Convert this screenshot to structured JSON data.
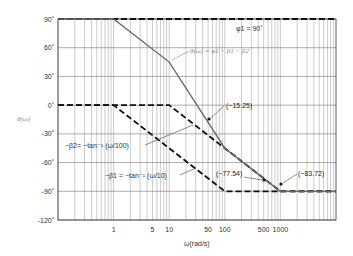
{
  "chart_data": {
    "type": "line",
    "title": "",
    "xlabel": "ω(rad/s)",
    "ylabel": "θ(ω)",
    "xscale": "log",
    "xlim": [
      0.1,
      10000
    ],
    "ylim": [
      -120,
      90
    ],
    "x_tick_labels": [
      "1",
      "5",
      "10",
      "50",
      "100",
      "500",
      "1000"
    ],
    "x_tick_values": [
      1,
      5,
      10,
      50,
      100,
      500,
      1000
    ],
    "y_tick_labels": [
      "90˚",
      "60˚",
      "30˚",
      "0˚",
      "-30˚",
      "-60˚",
      "-90˚",
      "-120˚"
    ],
    "y_tick_values": [
      90,
      60,
      30,
      0,
      -30,
      -60,
      -90,
      -120
    ],
    "grid": true,
    "series": [
      {
        "name": "φ1 = 90˚",
        "style": "dashed",
        "x": [
          0.1,
          10000
        ],
        "y": [
          90,
          90
        ]
      },
      {
        "name": "−β1 = −tan⁻¹(ω/10)",
        "style": "dashed",
        "x": [
          0.1,
          1,
          100,
          10000
        ],
        "y": [
          0,
          0,
          -90,
          -90
        ]
      },
      {
        "name": "−β2 = −tan⁻¹(ω/100)",
        "style": "dashed",
        "x": [
          0.1,
          10,
          1000,
          10000
        ],
        "y": [
          0,
          0,
          -90,
          -90
        ]
      },
      {
        "name": "θ(ω) = φ1 − β1 − β2",
        "style": "solid",
        "x": [
          0.1,
          1,
          10,
          100,
          1000,
          10000
        ],
        "y": [
          90,
          90,
          45,
          -45,
          -90,
          -90
        ]
      }
    ],
    "annotations": [
      {
        "text": "(−15.25)",
        "x": 50,
        "y": -15.25
      },
      {
        "text": "(−77.54)",
        "x": 500,
        "y": -77.54
      },
      {
        "text": "(−83.72)",
        "x": 1000,
        "y": -83.72
      }
    ]
  },
  "labels": {
    "phi1": "φ1 = 90˚",
    "theta": "θ(ω) = φ1 − β1 − β2",
    "beta2": "−β2= −tan⁻¹ (ω/100)",
    "beta1": "−β1 = −tan⁻¹ (ω/10)",
    "ann1": "(−15.25)",
    "ann2": "(−77.54)",
    "ann3": "(−83.72)",
    "ylabel": "θ(ω)",
    "xlabel": "ω(rad/s)"
  }
}
